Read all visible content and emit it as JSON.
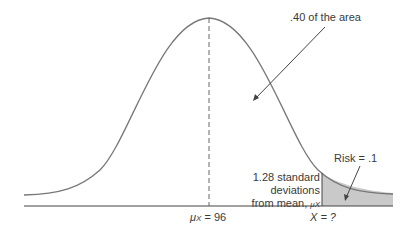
{
  "diagram": {
    "type": "normal-distribution",
    "labels": {
      "area": ".40 of the area",
      "risk": "Risk = .1",
      "sd_line1": "1.28 standard",
      "sd_line2": "deviations",
      "sd_line3": "from mean, ",
      "mu_symbol": "μ",
      "mu_sub": "X",
      "mean_symbol": "μ",
      "mean_sub": "X",
      "mean_value": " = 96",
      "x_label": "X = ?"
    },
    "colors": {
      "curve": "#777777",
      "baseline": "#444444",
      "shade": "#c9c9c9",
      "arrow": "#444444"
    }
  }
}
